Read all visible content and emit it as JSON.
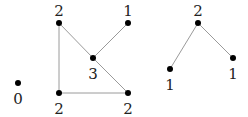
{
  "diagram": {
    "type": "graph-degree-labels",
    "edge_color": "#9a9a9a",
    "node_color": "#000000",
    "nodes": [
      {
        "id": "iso",
        "x": 18,
        "y": 83,
        "label": "0",
        "lx": 18,
        "ly": 104
      },
      {
        "id": "a",
        "x": 59,
        "y": 23,
        "label": "2",
        "lx": 59,
        "ly": 16
      },
      {
        "id": "b",
        "x": 128,
        "y": 23,
        "label": "1",
        "lx": 128,
        "ly": 16
      },
      {
        "id": "c",
        "x": 93,
        "y": 58,
        "label": "3",
        "lx": 93,
        "ly": 79
      },
      {
        "id": "d",
        "x": 59,
        "y": 93,
        "label": "2",
        "lx": 59,
        "ly": 114
      },
      {
        "id": "e",
        "x": 128,
        "y": 93,
        "label": "2",
        "lx": 128,
        "ly": 114
      },
      {
        "id": "f",
        "x": 198,
        "y": 23,
        "label": "2",
        "lx": 198,
        "ly": 16
      },
      {
        "id": "g",
        "x": 170,
        "y": 69,
        "label": "1",
        "lx": 170,
        "ly": 90
      },
      {
        "id": "h",
        "x": 233,
        "y": 58,
        "label": "1",
        "lx": 233,
        "ly": 79
      }
    ],
    "edges": [
      [
        "a",
        "d"
      ],
      [
        "a",
        "c"
      ],
      [
        "c",
        "e"
      ],
      [
        "c",
        "b"
      ],
      [
        "d",
        "e"
      ],
      [
        "f",
        "g"
      ],
      [
        "f",
        "h"
      ]
    ]
  }
}
